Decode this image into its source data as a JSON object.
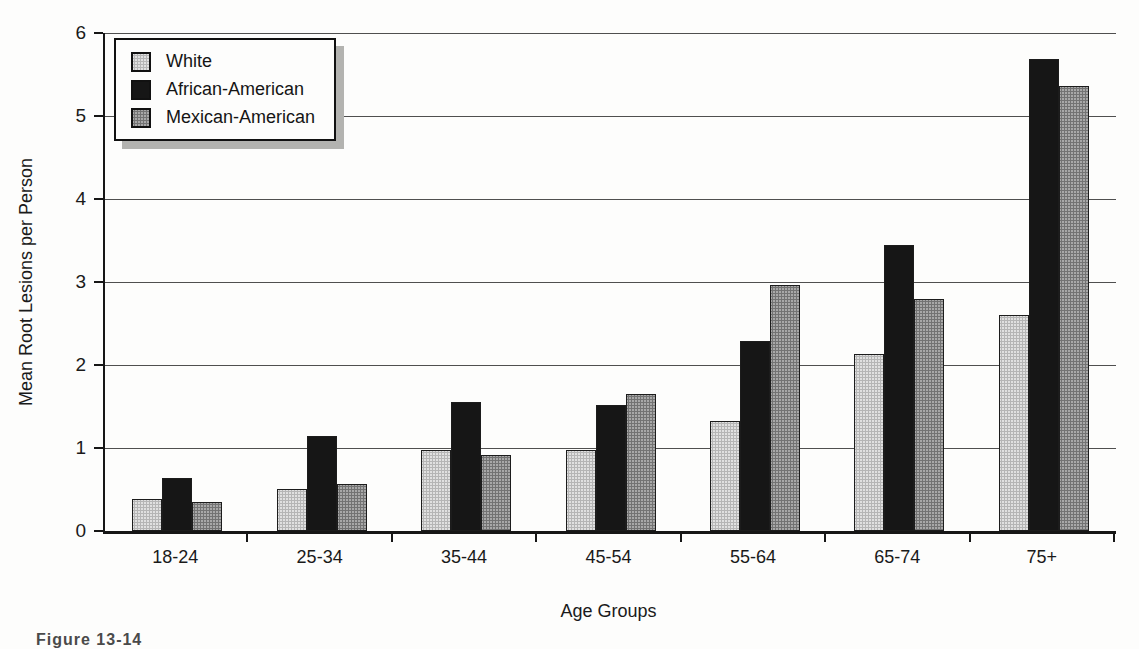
{
  "figure": {
    "caption_partial": "Figure 13-14",
    "background_color": "#fdfdfc"
  },
  "chart_data": {
    "type": "bar",
    "title": "",
    "xlabel": "Age Groups",
    "ylabel": "Mean Root Lesions per Person",
    "ylim": [
      0,
      6
    ],
    "y_ticks": [
      0,
      1,
      2,
      3,
      4,
      5,
      6
    ],
    "grid": "horizontal",
    "legend_position": "top-left-inside",
    "categories": [
      "18-24",
      "25-34",
      "35-44",
      "45-54",
      "55-64",
      "65-74",
      "75+"
    ],
    "series": [
      {
        "name": "White",
        "color": "#e0e0e0",
        "values": [
          0.39,
          0.51,
          0.98,
          0.98,
          1.33,
          2.13,
          2.6
        ]
      },
      {
        "name": "African-American",
        "color": "#161616",
        "values": [
          0.64,
          1.15,
          1.56,
          1.52,
          2.29,
          3.44,
          5.69
        ]
      },
      {
        "name": "Mexican-American",
        "color": "#a8a8a8",
        "values": [
          0.35,
          0.57,
          0.92,
          1.65,
          2.96,
          2.8,
          5.36
        ]
      }
    ]
  }
}
